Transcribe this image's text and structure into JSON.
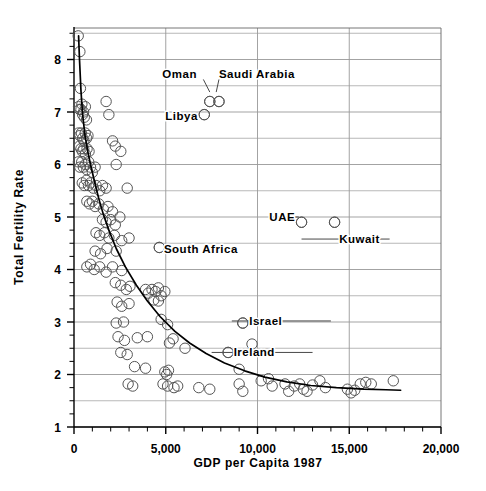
{
  "chart_data": {
    "type": "scatter",
    "title": "",
    "xlabel": "GDP per Capita 1987",
    "ylabel": "Total Fertility Rate",
    "xlim": [
      0,
      20000
    ],
    "ylim": [
      1,
      8.6
    ],
    "xticks": [
      0,
      5000,
      10000,
      15000,
      20000
    ],
    "xticklabels": [
      "0",
      "5,000",
      "10,000",
      "15,000",
      "20,000"
    ],
    "yticks": [
      1,
      2,
      3,
      4,
      5,
      6,
      7,
      8
    ],
    "yticklabels": [
      "1",
      "2",
      "3",
      "4",
      "5",
      "6",
      "7",
      "8"
    ],
    "x_minor_tick_interval": 1000,
    "y_minor_tick_interval": 0.25,
    "grid": {
      "horizontal": true,
      "horizontal_interval": 0.5,
      "vertical": true,
      "vertical_interval": 5000,
      "color": "#999999"
    },
    "legend": null,
    "marker": {
      "shape": "open-circle",
      "radius": 5.2,
      "edge_color": "#555555",
      "fill": "none"
    },
    "fit_curve": {
      "description": "fitted decaying curve of fertility vs GDP per capita",
      "color": "#000000",
      "points": [
        [
          250,
          8.45
        ],
        [
          300,
          8.0
        ],
        [
          380,
          7.4
        ],
        [
          470,
          6.95
        ],
        [
          600,
          6.55
        ],
        [
          750,
          6.25
        ],
        [
          900,
          6.0
        ],
        [
          1100,
          5.7
        ],
        [
          1350,
          5.35
        ],
        [
          1600,
          5.05
        ],
        [
          1900,
          4.75
        ],
        [
          2300,
          4.4
        ],
        [
          2800,
          4.05
        ],
        [
          3400,
          3.7
        ],
        [
          4000,
          3.4
        ],
        [
          4700,
          3.1
        ],
        [
          5500,
          2.82
        ],
        [
          6300,
          2.6
        ],
        [
          7200,
          2.4
        ],
        [
          8200,
          2.22
        ],
        [
          9300,
          2.07
        ],
        [
          10400,
          1.95
        ],
        [
          11600,
          1.86
        ],
        [
          12900,
          1.79
        ],
        [
          14300,
          1.75
        ],
        [
          15800,
          1.72
        ],
        [
          17000,
          1.71
        ],
        [
          17800,
          1.7
        ]
      ]
    },
    "annotations": [
      {
        "label": "Oman",
        "point": [
          7400,
          7.2
        ],
        "label_x": 6700,
        "label_y": 7.72,
        "anchor": "end",
        "leader": [
          [
            7050,
            7.62
          ],
          [
            7400,
            7.38
          ]
        ]
      },
      {
        "label": "Saudi Arabia",
        "point": [
          7900,
          7.2
        ],
        "label_x": 7900,
        "label_y": 7.72,
        "anchor": "start",
        "leader": [
          [
            7900,
            7.62
          ],
          [
            7750,
            7.38
          ]
        ]
      },
      {
        "label": "Libya",
        "point": [
          7100,
          6.95
        ],
        "label_x": 6750,
        "label_y": 6.92,
        "anchor": "end",
        "leader": null
      },
      {
        "label": "UAE",
        "point": [
          12400,
          4.9
        ],
        "label_x": 12050,
        "label_y": 5.0,
        "anchor": "end",
        "leader": [
          [
            10800,
            5.0
          ],
          [
            12250,
            5.0
          ]
        ]
      },
      {
        "label": "Kuwait",
        "point": [
          14200,
          4.9
        ],
        "label_x": 14450,
        "label_y": 4.58,
        "anchor": "start",
        "leader": [
          [
            12400,
            4.58
          ],
          [
            17200,
            4.58
          ]
        ]
      },
      {
        "label": "South Africa",
        "point": [
          4650,
          4.42
        ],
        "label_x": 4900,
        "label_y": 4.4,
        "anchor": "start",
        "leader": null
      },
      {
        "label": "Israel",
        "point": [
          9200,
          2.98
        ],
        "label_x": 9550,
        "label_y": 3.02,
        "anchor": "start",
        "leader": [
          [
            8600,
            3.02
          ],
          [
            14000,
            3.02
          ]
        ]
      },
      {
        "label": "Ireland",
        "point": [
          8400,
          2.42
        ],
        "label_x": 8700,
        "label_y": 2.42,
        "anchor": "start",
        "leader": [
          [
            7500,
            2.42
          ],
          [
            13000,
            2.42
          ]
        ]
      }
    ],
    "points": [
      [
        230,
        8.45
      ],
      [
        320,
        8.15
      ],
      [
        350,
        7.45
      ],
      [
        250,
        7.1
      ],
      [
        300,
        7.05
      ],
      [
        380,
        7.05
      ],
      [
        430,
        7.15
      ],
      [
        470,
        6.95
      ],
      [
        520,
        7.0
      ],
      [
        560,
        6.9
      ],
      [
        620,
        7.1
      ],
      [
        680,
        6.85
      ],
      [
        1750,
        7.2
      ],
      [
        1900,
        6.95
      ],
      [
        7400,
        7.2
      ],
      [
        7900,
        7.2
      ],
      [
        7100,
        6.95
      ],
      [
        250,
        6.6
      ],
      [
        320,
        6.55
      ],
      [
        400,
        6.6
      ],
      [
        470,
        6.5
      ],
      [
        540,
        6.45
      ],
      [
        610,
        6.6
      ],
      [
        690,
        6.5
      ],
      [
        760,
        6.55
      ],
      [
        300,
        6.35
      ],
      [
        380,
        6.3
      ],
      [
        450,
        6.25
      ],
      [
        530,
        6.3
      ],
      [
        620,
        6.2
      ],
      [
        710,
        6.3
      ],
      [
        820,
        6.25
      ],
      [
        2100,
        6.45
      ],
      [
        2250,
        6.35
      ],
      [
        2550,
        6.25
      ],
      [
        2300,
        6.0
      ],
      [
        240,
        6.05
      ],
      [
        320,
        5.95
      ],
      [
        420,
        6.05
      ],
      [
        510,
        5.95
      ],
      [
        610,
        6.0
      ],
      [
        700,
        5.9
      ],
      [
        800,
        6.05
      ],
      [
        900,
        5.95
      ],
      [
        1000,
        5.85
      ],
      [
        1150,
        5.95
      ],
      [
        450,
        5.65
      ],
      [
        560,
        5.6
      ],
      [
        680,
        5.7
      ],
      [
        790,
        5.6
      ],
      [
        900,
        5.65
      ],
      [
        1050,
        5.55
      ],
      [
        1200,
        5.6
      ],
      [
        1400,
        5.5
      ],
      [
        1550,
        5.6
      ],
      [
        1750,
        5.55
      ],
      [
        2900,
        5.55
      ],
      [
        700,
        5.3
      ],
      [
        850,
        5.25
      ],
      [
        1000,
        5.3
      ],
      [
        1150,
        5.2
      ],
      [
        1350,
        5.25
      ],
      [
        1600,
        5.15
      ],
      [
        1850,
        5.2
      ],
      [
        2100,
        5.1
      ],
      [
        1550,
        4.95
      ],
      [
        1750,
        4.9
      ],
      [
        2000,
        4.95
      ],
      [
        2250,
        4.85
      ],
      [
        2500,
        5.0
      ],
      [
        12400,
        4.9
      ],
      [
        14200,
        4.9
      ],
      [
        1200,
        4.7
      ],
      [
        1400,
        4.65
      ],
      [
        1650,
        4.7
      ],
      [
        1900,
        4.6
      ],
      [
        2200,
        4.65
      ],
      [
        2600,
        4.55
      ],
      [
        3000,
        4.6
      ],
      [
        1150,
        4.35
      ],
      [
        1450,
        4.3
      ],
      [
        1800,
        4.4
      ],
      [
        2300,
        4.35
      ],
      [
        4650,
        4.42
      ],
      [
        700,
        4.05
      ],
      [
        900,
        4.1
      ],
      [
        1100,
        4.0
      ],
      [
        1400,
        4.05
      ],
      [
        1750,
        3.95
      ],
      [
        2100,
        4.05
      ],
      [
        2600,
        3.98
      ],
      [
        2250,
        3.75
      ],
      [
        2550,
        3.7
      ],
      [
        2850,
        3.62
      ],
      [
        3050,
        3.68
      ],
      [
        3900,
        3.62
      ],
      [
        4050,
        3.55
      ],
      [
        4250,
        3.62
      ],
      [
        4450,
        3.58
      ],
      [
        4600,
        3.65
      ],
      [
        4750,
        3.5
      ],
      [
        4950,
        3.58
      ],
      [
        4350,
        3.42
      ],
      [
        4600,
        3.4
      ],
      [
        2350,
        3.38
      ],
      [
        2600,
        3.3
      ],
      [
        3000,
        3.35
      ],
      [
        2300,
        2.98
      ],
      [
        2700,
        3.0
      ],
      [
        4750,
        3.05
      ],
      [
        5100,
        2.95
      ],
      [
        9200,
        2.98
      ],
      [
        2400,
        2.72
      ],
      [
        2750,
        2.65
      ],
      [
        3450,
        2.7
      ],
      [
        4000,
        2.72
      ],
      [
        5200,
        2.6
      ],
      [
        5400,
        2.68
      ],
      [
        6050,
        2.5
      ],
      [
        8400,
        2.42
      ],
      [
        9700,
        2.58
      ],
      [
        2550,
        2.42
      ],
      [
        2900,
        2.38
      ],
      [
        3300,
        2.15
      ],
      [
        3900,
        2.12
      ],
      [
        4950,
        2.05
      ],
      [
        5050,
        2.0
      ],
      [
        5150,
        2.08
      ],
      [
        9000,
        2.1
      ],
      [
        10600,
        1.92
      ],
      [
        2950,
        1.82
      ],
      [
        3200,
        1.78
      ],
      [
        4850,
        1.82
      ],
      [
        5100,
        1.78
      ],
      [
        5450,
        1.75
      ],
      [
        5650,
        1.78
      ],
      [
        6800,
        1.75
      ],
      [
        7400,
        1.72
      ],
      [
        9000,
        1.82
      ],
      [
        9200,
        1.68
      ],
      [
        10200,
        1.88
      ],
      [
        10800,
        1.78
      ],
      [
        11500,
        1.82
      ],
      [
        11700,
        1.68
      ],
      [
        12000,
        1.78
      ],
      [
        12300,
        1.82
      ],
      [
        12500,
        1.72
      ],
      [
        12700,
        1.68
      ],
      [
        13000,
        1.8
      ],
      [
        13400,
        1.88
      ],
      [
        13700,
        1.75
      ],
      [
        14900,
        1.72
      ],
      [
        15100,
        1.65
      ],
      [
        15300,
        1.7
      ],
      [
        15600,
        1.82
      ],
      [
        15900,
        1.85
      ],
      [
        16200,
        1.82
      ],
      [
        17400,
        1.88
      ]
    ]
  },
  "icons": {
    "marker": "open-circle-marker",
    "fit": "trend-curve"
  }
}
